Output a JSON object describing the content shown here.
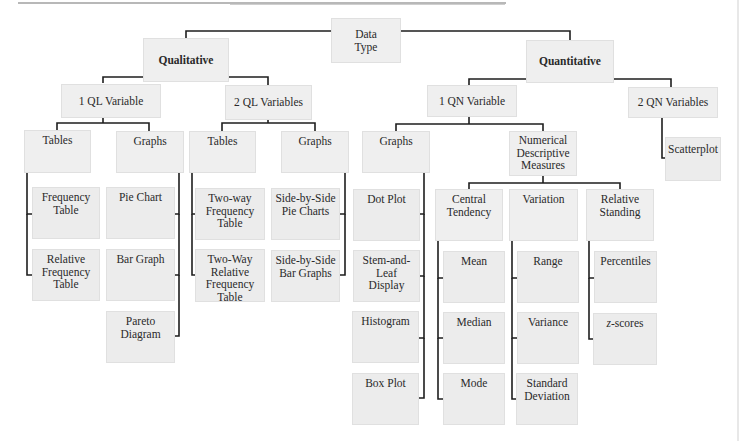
{
  "diagram": {
    "root": "Data Type",
    "qualitative": {
      "label": "Qualitative",
      "one_var": {
        "label": "1 QL Variable",
        "tables": {
          "label": "Tables",
          "items": [
            "Frequency Table",
            "Relative Frequency Table"
          ]
        },
        "graphs": {
          "label": "Graphs",
          "items": [
            "Pie Chart",
            "Bar Graph",
            "Pareto Diagram"
          ]
        }
      },
      "two_var": {
        "label": "2 QL Variables",
        "tables": {
          "label": "Tables",
          "items": [
            "Two-way Frequency Table",
            "Two-Way Relative Frequency Table"
          ]
        },
        "graphs": {
          "label": "Graphs",
          "items": [
            "Side-by-Side Pie Charts",
            "Side-by-Side Bar Graphs"
          ]
        }
      }
    },
    "quantitative": {
      "label": "Quantitative",
      "one_var": {
        "label": "1 QN Variable",
        "graphs": {
          "label": "Graphs",
          "items": [
            "Dot Plot",
            "Stem-and-Leaf Display",
            "Histogram",
            "Box Plot"
          ]
        },
        "numerical": {
          "label": "Numerical Descriptive Measures",
          "central": {
            "label": "Central Tendency",
            "items": [
              "Mean",
              "Median",
              "Mode"
            ]
          },
          "variation": {
            "label": "Variation",
            "items": [
              "Range",
              "Variance",
              "Standard Deviation"
            ]
          },
          "relative": {
            "label": "Relative Standing",
            "items": [
              "Percentiles",
              "z-scores"
            ]
          }
        }
      },
      "two_var": {
        "label": "2 QN Variables",
        "items": [
          "Scatterplot"
        ]
      }
    }
  },
  "colors": {
    "box_fill": "#efefef",
    "line": "#1e1e1e",
    "text": "#2a2a2a"
  }
}
